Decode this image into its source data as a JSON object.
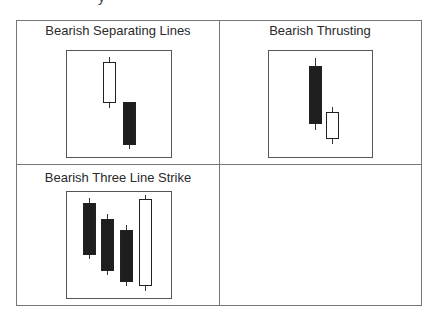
{
  "top_fragment": "y",
  "panels": [
    {
      "title": "Bearish Separating Lines",
      "title_pos": {
        "left": 17,
        "width": 202,
        "top": 23
      },
      "box": {
        "left": 66,
        "top": 50,
        "width": 106,
        "height": 108
      },
      "candles": [
        {
          "color": "white",
          "x": 103,
          "w": 13,
          "body_top": 62,
          "body_bottom": 103,
          "wick_top": 57,
          "wick_bottom": 108
        },
        {
          "color": "black",
          "x": 123,
          "w": 13,
          "body_top": 102,
          "body_bottom": 145,
          "wick_top": 102,
          "wick_bottom": 149
        }
      ]
    },
    {
      "title": "Bearish Thrusting",
      "title_pos": {
        "left": 220,
        "width": 200,
        "top": 23
      },
      "box": {
        "left": 268,
        "top": 50,
        "width": 105,
        "height": 108
      },
      "candles": [
        {
          "color": "black",
          "x": 309,
          "w": 13,
          "body_top": 66,
          "body_bottom": 124,
          "wick_top": 58,
          "wick_bottom": 130
        },
        {
          "color": "white",
          "x": 326,
          "w": 13,
          "body_top": 112,
          "body_bottom": 139,
          "wick_top": 107,
          "wick_bottom": 144
        }
      ]
    },
    {
      "title": "Bearish Three Line Strike",
      "title_pos": {
        "left": 17,
        "width": 202,
        "top": 170
      },
      "box": {
        "left": 66,
        "top": 191,
        "width": 106,
        "height": 108
      },
      "candles": [
        {
          "color": "black",
          "x": 83,
          "w": 13,
          "body_top": 203,
          "body_bottom": 255,
          "wick_top": 198,
          "wick_bottom": 259
        },
        {
          "color": "black",
          "x": 101,
          "w": 13,
          "body_top": 219,
          "body_bottom": 271,
          "wick_top": 214,
          "wick_bottom": 275
        },
        {
          "color": "black",
          "x": 120,
          "w": 13,
          "body_top": 230,
          "body_bottom": 282,
          "wick_top": 225,
          "wick_bottom": 286
        },
        {
          "color": "white",
          "x": 139,
          "w": 13,
          "body_top": 199,
          "body_bottom": 286,
          "wick_top": 195,
          "wick_bottom": 291
        }
      ]
    }
  ]
}
